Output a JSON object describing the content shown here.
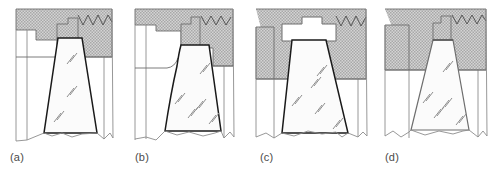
{
  "figure": {
    "type": "technical-cross-section-diagram",
    "background_color": "#ffffff",
    "panel_count": 4
  },
  "style": {
    "hatch_fill": "#d2d2d2",
    "hatch_stipple": "#9a9a9a",
    "nugget_fill": "#fbfbfb",
    "outline_dark": "#1a1a1a",
    "outline_mid": "#6e6e6e",
    "outline_light": "#8c8c8c",
    "label_color": "#4a4a4a",
    "thread_color": "#555555",
    "grain_mark_color": "#8e8e8e"
  },
  "panels": [
    {
      "id": "panel-a",
      "label": "(a)",
      "x": 0,
      "nugget_top_width": 56,
      "nugget_bottom_width": 104,
      "nugget_depth": "shallow",
      "shoulder_step": "small",
      "thread_teeth": 6,
      "grain_marks": 3,
      "outline_weight": "heavy"
    },
    {
      "id": "panel-b",
      "label": "(b)",
      "x": 125,
      "nugget_top_width": 60,
      "nugget_bottom_width": 112,
      "nugget_depth": "medium",
      "shoulder_step": "medium",
      "thread_teeth": 5,
      "grain_marks": 5,
      "outline_weight": "heavy"
    },
    {
      "id": "panel-c",
      "label": "(c)",
      "x": 250,
      "nugget_top_width": 66,
      "nugget_bottom_width": 118,
      "nugget_depth": "deep",
      "shoulder_step": "large",
      "thread_teeth": 6,
      "grain_marks": 5,
      "outline_weight": "heavy"
    },
    {
      "id": "panel-d",
      "label": "(d)",
      "x": 375,
      "nugget_top_width": 44,
      "nugget_bottom_width": 116,
      "nugget_depth": "medium",
      "shoulder_step": "wide-flange",
      "thread_teeth": 6,
      "grain_marks": 5,
      "outline_weight": "light"
    }
  ]
}
